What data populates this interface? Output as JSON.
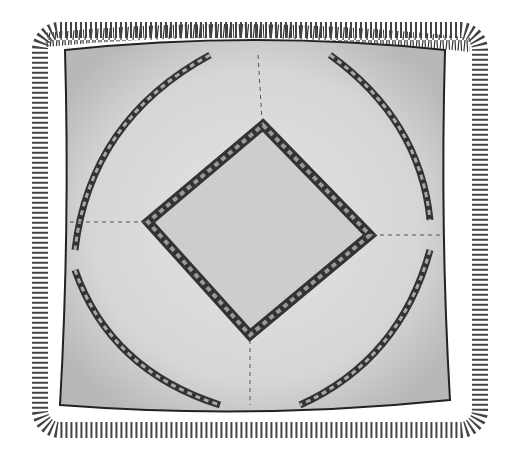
{
  "image": {
    "subject": "fringed square pillow illustration",
    "colors": {
      "background": "#ffffff",
      "pillow": "#d9d9d9",
      "center": "#cfcfcf",
      "ink": "#2a2a2a"
    }
  }
}
